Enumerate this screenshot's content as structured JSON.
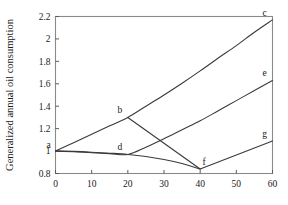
{
  "chart_data": {
    "type": "line",
    "title": "",
    "xlabel": "",
    "ylabel": "Generalized annual oil consumption",
    "xlim": [
      0,
      60
    ],
    "ylim": [
      0.8,
      2.2
    ],
    "xticks": [
      0,
      10,
      20,
      30,
      40,
      50,
      60
    ],
    "yticks": [
      0.8,
      1,
      1.2,
      1.4,
      1.6,
      1.8,
      2,
      2.2
    ],
    "xtick_labels": [
      "0",
      "10",
      "20",
      "30",
      "40",
      "50",
      "60"
    ],
    "ytick_labels": [
      "0.8",
      "1",
      "1.2",
      "1.4",
      "1.6",
      "1.8",
      "2",
      "2.2"
    ],
    "grid": false,
    "legend": "none",
    "point_labels": [
      {
        "id": "a",
        "label": "a",
        "x": 0,
        "y": 1.0
      },
      {
        "id": "b",
        "label": "b",
        "x": 20,
        "y": 1.3
      },
      {
        "id": "c",
        "label": "c",
        "x": 60,
        "y": 2.17
      },
      {
        "id": "d",
        "label": "d",
        "x": 20,
        "y": 0.97
      },
      {
        "id": "e",
        "label": "e",
        "x": 60,
        "y": 1.63
      },
      {
        "id": "f",
        "label": "f",
        "x": 40,
        "y": 0.84
      },
      {
        "id": "g",
        "label": "g",
        "x": 60,
        "y": 1.09
      }
    ],
    "series": [
      {
        "name": "a-b-c",
        "values": [
          {
            "x": 0,
            "y": 1.0
          },
          {
            "x": 5,
            "y": 1.075
          },
          {
            "x": 10,
            "y": 1.15
          },
          {
            "x": 15,
            "y": 1.225
          },
          {
            "x": 20,
            "y": 1.3
          },
          {
            "x": 25,
            "y": 1.4
          },
          {
            "x": 30,
            "y": 1.5
          },
          {
            "x": 35,
            "y": 1.605
          },
          {
            "x": 40,
            "y": 1.715
          },
          {
            "x": 45,
            "y": 1.83
          },
          {
            "x": 50,
            "y": 1.94
          },
          {
            "x": 55,
            "y": 2.06
          },
          {
            "x": 60,
            "y": 2.17
          }
        ]
      },
      {
        "name": "a-d-e",
        "values": [
          {
            "x": 0,
            "y": 1.0
          },
          {
            "x": 5,
            "y": 0.995
          },
          {
            "x": 10,
            "y": 0.985
          },
          {
            "x": 15,
            "y": 0.977
          },
          {
            "x": 20,
            "y": 0.97
          },
          {
            "x": 25,
            "y": 1.035
          },
          {
            "x": 30,
            "y": 1.11
          },
          {
            "x": 35,
            "y": 1.19
          },
          {
            "x": 40,
            "y": 1.27
          },
          {
            "x": 45,
            "y": 1.36
          },
          {
            "x": 50,
            "y": 1.45
          },
          {
            "x": 55,
            "y": 1.54
          },
          {
            "x": 60,
            "y": 1.63
          }
        ]
      },
      {
        "name": "a-d-f",
        "values": [
          {
            "x": 0,
            "y": 1.0
          },
          {
            "x": 5,
            "y": 0.997
          },
          {
            "x": 10,
            "y": 0.99
          },
          {
            "x": 15,
            "y": 0.981
          },
          {
            "x": 20,
            "y": 0.97
          },
          {
            "x": 25,
            "y": 0.952
          },
          {
            "x": 30,
            "y": 0.925
          },
          {
            "x": 35,
            "y": 0.889
          },
          {
            "x": 40,
            "y": 0.84
          }
        ]
      },
      {
        "name": "b-f",
        "values": [
          {
            "x": 20,
            "y": 1.3
          },
          {
            "x": 40,
            "y": 0.84
          }
        ]
      },
      {
        "name": "f-g",
        "values": [
          {
            "x": 40,
            "y": 0.84
          },
          {
            "x": 60,
            "y": 1.09
          }
        ]
      }
    ]
  }
}
